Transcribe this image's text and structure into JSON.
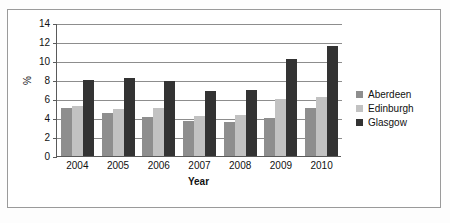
{
  "chart_data": {
    "type": "bar",
    "title": "",
    "xlabel": "Year",
    "ylabel": "%",
    "categories": [
      "2004",
      "2005",
      "2006",
      "2007",
      "2008",
      "2009",
      "2010"
    ],
    "series": [
      {
        "name": "Aberdeen",
        "color": "#8e8e8e",
        "values": [
          5.1,
          4.55,
          4.1,
          3.7,
          3.55,
          4.05,
          5.05
        ]
      },
      {
        "name": "Edinburgh",
        "color": "#c2c2c2",
        "values": [
          5.25,
          5.0,
          5.1,
          4.2,
          4.3,
          6.05,
          6.2
        ]
      },
      {
        "name": "Glasgow",
        "color": "#333333",
        "values": [
          8.0,
          8.2,
          7.85,
          6.85,
          6.9,
          10.2,
          11.6
        ]
      }
    ],
    "ylim": [
      0,
      14
    ],
    "yticks": [
      0,
      2,
      4,
      6,
      8,
      10,
      12,
      14
    ],
    "ytick_labels": [
      "0",
      "2",
      "4",
      "6",
      "8",
      "10",
      "12",
      "14"
    ],
    "grid": true,
    "legend_position": "right"
  }
}
